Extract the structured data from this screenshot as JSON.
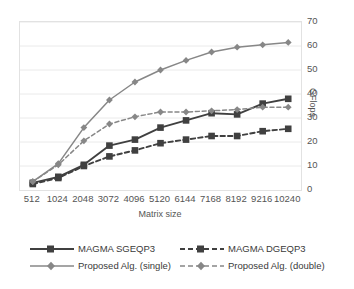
{
  "chart_data": {
    "type": "line",
    "title": "",
    "xlabel": "Matrix size",
    "ylabel": "GFlops",
    "categories": [
      "512",
      "1024",
      "2048",
      "3072",
      "4096",
      "5120",
      "6144",
      "7168",
      "8192",
      "9216",
      "10240"
    ],
    "ylim": [
      0,
      70
    ],
    "yticks": [
      "0",
      "10",
      "20",
      "30",
      "40",
      "50",
      "60",
      "70"
    ],
    "grid": "horizontal",
    "legend_position": "bottom",
    "series": [
      {
        "name": "MAGMA SGEQP3",
        "color": "#404040",
        "style": "solid",
        "marker": "square",
        "values": [
          3,
          5.5,
          10.5,
          18.5,
          21,
          26,
          29,
          32,
          31.5,
          36,
          38
        ]
      },
      {
        "name": "MAGMA DGEQP3",
        "color": "#404040",
        "style": "dashed",
        "marker": "square",
        "values": [
          2.5,
          5,
          10,
          14,
          16.5,
          19.5,
          21,
          22.5,
          22.5,
          24.5,
          25.5
        ]
      },
      {
        "name": "Proposed Alg. (single)",
        "color": "#878787",
        "style": "solid",
        "marker": "diamond",
        "values": [
          3.5,
          11,
          26,
          37.5,
          45,
          50,
          54,
          57.5,
          59.5,
          60.5,
          61.5
        ]
      },
      {
        "name": "Proposed Alg. (double)",
        "color": "#878787",
        "style": "dashed",
        "marker": "diamond",
        "values": [
          3.5,
          10.5,
          20.5,
          27.5,
          30.5,
          32.5,
          32.5,
          33,
          33.5,
          34.5,
          34.5
        ]
      }
    ]
  },
  "colors": {
    "dark_series": "#404040",
    "light_series": "#878787",
    "grid": "#eaeaea",
    "axis": "#b8b8b8",
    "text": "#555555",
    "background": "#ffffff"
  }
}
